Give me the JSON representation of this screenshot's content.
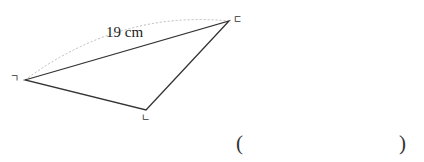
{
  "figure": {
    "type": "triangle",
    "side_length_label": "19 cm",
    "vertices": [
      {
        "label": "ㄱ",
        "x": 25,
        "y": 80
      },
      {
        "label": "ㄴ",
        "x": 146,
        "y": 110
      },
      {
        "label": "ㄷ",
        "x": 229,
        "y": 21
      }
    ],
    "colors": {
      "line": "#333333",
      "arc": "#bbbbbb"
    }
  },
  "answer": {
    "open": "(",
    "close": ")",
    "value": ""
  }
}
